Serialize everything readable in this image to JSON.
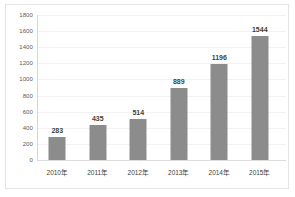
{
  "chart_data": {
    "type": "bar",
    "title": "",
    "xlabel": "",
    "ylabel": "",
    "categories": [
      "2010年",
      "2011年",
      "2012年",
      "2013年",
      "2014年",
      "2015年"
    ],
    "values": [
      283,
      435,
      514,
      889,
      1196,
      1544
    ],
    "value_labels": [
      "283",
      "435",
      "514",
      "889",
      "1196",
      "1544"
    ],
    "ylim": [
      0,
      1800
    ],
    "ytick_step": 200,
    "yticks": [
      1800,
      1600,
      1400,
      1200,
      1000,
      800,
      600,
      400,
      200,
      0
    ],
    "ytick_labels": [
      "1800",
      "1600",
      "1400",
      "1200",
      "1000",
      "800",
      "600",
      "400",
      "200",
      "0"
    ],
    "grid": true,
    "grid_orientation": "horizontal",
    "legend": false,
    "legend_position": "none",
    "bar_color": "#8c8c8c",
    "plot_background": "#ffffff",
    "border_color": "#e3e3e3",
    "gridline_color": "#f2f2f2",
    "axis_color": "#d8d8d8",
    "value_label_color": "#3f3f3f",
    "tick_label_color": "#595959"
  }
}
